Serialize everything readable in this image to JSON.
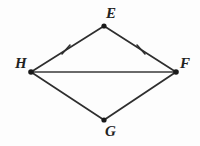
{
  "figure": {
    "background_color": "#fdfdfd",
    "stroke_color": "#2e2e2e",
    "vertex_color": "#1a1a1a",
    "vertices": [
      {
        "name": "E",
        "label": "E",
        "x": 104,
        "y": 26,
        "label_x": 106,
        "label_y": 6
      },
      {
        "name": "H",
        "label": "H",
        "x": 31,
        "y": 72,
        "label_x": 15,
        "label_y": 56
      },
      {
        "name": "F",
        "label": "F",
        "x": 176,
        "y": 72,
        "label_x": 180,
        "label_y": 56
      },
      {
        "name": "G",
        "label": "G",
        "x": 104,
        "y": 120,
        "label_x": 105,
        "label_y": 124
      }
    ],
    "segments": [
      {
        "name": "HE",
        "from": "H",
        "to": "E",
        "x1": 31,
        "y1": 72,
        "x2": 104,
        "y2": 26,
        "ticks": 1
      },
      {
        "name": "EF",
        "from": "E",
        "to": "F",
        "x1": 104,
        "y1": 26,
        "x2": 176,
        "y2": 72,
        "ticks": 1
      },
      {
        "name": "HF",
        "from": "H",
        "to": "F",
        "x1": 31,
        "y1": 72,
        "x2": 176,
        "y2": 72,
        "ticks": 0
      },
      {
        "name": "HG",
        "from": "H",
        "to": "G",
        "x1": 31,
        "y1": 72,
        "x2": 104,
        "y2": 120,
        "ticks": 0
      },
      {
        "name": "GF",
        "from": "G",
        "to": "F",
        "x1": 104,
        "y1": 120,
        "x2": 176,
        "y2": 72,
        "ticks": 0
      }
    ],
    "tick_marks": [
      {
        "name": "tick-HE",
        "on_segment": "HE",
        "x": 66,
        "y": 50
      },
      {
        "name": "tick-EF",
        "on_segment": "EF",
        "x": 141,
        "y": 50
      }
    ],
    "labels": {
      "E": "E",
      "H": "H",
      "F": "F",
      "G": "G"
    }
  }
}
